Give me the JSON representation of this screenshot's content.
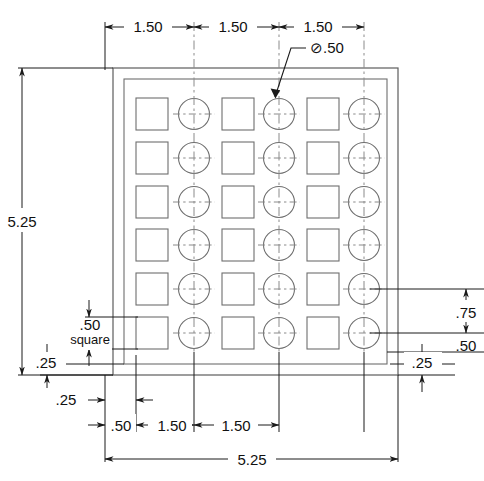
{
  "drawing": {
    "title": "Perforated Plate Pattern Detail Drawing",
    "units": "inches",
    "line_color": "#1a1a1a",
    "feature_color": "#6e6e6e",
    "center_line_color": "#8a8a8a",
    "background": "#ffffff"
  },
  "part": {
    "name": "square-plate",
    "overall_width": "5.25",
    "overall_height": "5.25",
    "inner_border_offset": ".25"
  },
  "pattern": {
    "rows": 6,
    "columns": 6,
    "square_hole_label": ".50",
    "square_hole_note": "square",
    "round_hole_label": "⊘.50",
    "column_pitch": "1.50",
    "row_pitch": "1.50"
  },
  "dimensions": {
    "top": [
      {
        "name": "top-dim-1",
        "value": "1.50"
      },
      {
        "name": "top-dim-2",
        "value": "1.50"
      },
      {
        "name": "top-dim-3",
        "value": "1.50"
      }
    ],
    "bottom_chain": [
      {
        "name": "bottom-dim-0",
        "value": ".50"
      },
      {
        "name": "bottom-dim-1",
        "value": "1.50"
      },
      {
        "name": "bottom-dim-2",
        "value": "1.50"
      }
    ],
    "bottom_edge_offset": {
      "name": "bottom-edge-offset",
      "value": ".25"
    },
    "bottom_overall": {
      "name": "bottom-overall",
      "value": "5.25"
    },
    "left_overall": {
      "name": "left-overall",
      "value": "5.25"
    },
    "left_detail": [
      {
        "name": "left-square-size",
        "value": ".50"
      },
      {
        "name": "left-square-note",
        "value": "square"
      },
      {
        "name": "left-inner-offset",
        "value": ".25"
      }
    ],
    "right": [
      {
        "name": "right-dim-075",
        "value": ".75"
      },
      {
        "name": "right-dim-050",
        "value": ".50"
      },
      {
        "name": "right-dim-025",
        "value": ".25"
      }
    ],
    "leader": {
      "name": "diameter-leader",
      "value": "⊘.50"
    }
  }
}
